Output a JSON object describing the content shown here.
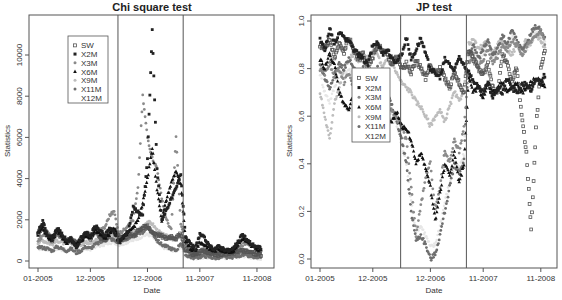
{
  "chart_data": [
    {
      "type": "scatter",
      "title": "Chi square test",
      "xlabel": "Date",
      "ylabel": "Statistics",
      "x_unit": "months since 01-2005",
      "xlim": [
        -1,
        48
      ],
      "ylim": [
        -400,
        11700
      ],
      "x_ticks": [
        {
          "value": 0,
          "label": "01-2005"
        },
        {
          "value": 11,
          "label": "12-2005"
        },
        {
          "value": 23,
          "label": "12-2006"
        },
        {
          "value": 34,
          "label": "11-2007"
        },
        {
          "value": 46,
          "label": "11-2008"
        }
      ],
      "y_ticks": [
        {
          "value": 0,
          "label": "0"
        },
        {
          "value": 2000,
          "label": "2000"
        },
        {
          "value": 4000,
          "label": "4000"
        },
        {
          "value": 6000,
          "label": "6000"
        },
        {
          "value": 8000,
          "label": "8000"
        },
        {
          "value": 10000,
          "label": "10000"
        }
      ],
      "vertical_lines": [
        16.8,
        30.5
      ],
      "legend_position": "top-left",
      "grid": false,
      "x": [
        0,
        1,
        2,
        3,
        4,
        5,
        6,
        7,
        8,
        9,
        10,
        11,
        12,
        13,
        14,
        15,
        16,
        17,
        18,
        19,
        20,
        21,
        22,
        23,
        24,
        25,
        26,
        27,
        28,
        29,
        30,
        31,
        32,
        33,
        34,
        35,
        36,
        37,
        38,
        39,
        40,
        41,
        42,
        43,
        44,
        45,
        46,
        47
      ],
      "series": [
        {
          "name": "SW",
          "marker": "open-square",
          "color": "#555555",
          "values": [
            1300,
            1700,
            1200,
            1000,
            1500,
            1200,
            900,
            1100,
            800,
            1000,
            1300,
            1100,
            1500,
            1200,
            1000,
            1400,
            1500,
            1200,
            1100,
            1300,
            1200,
            1500,
            1600,
            1700,
            1400,
            1300,
            1200,
            1100,
            1200,
            1100,
            1300,
            600,
            400,
            300,
            400,
            500,
            400,
            350,
            300,
            400,
            350,
            400,
            500,
            500,
            450,
            400,
            350,
            300
          ]
        },
        {
          "name": "X2M",
          "marker": "filled-square",
          "color": "#222222",
          "values": [
            1400,
            1900,
            1300,
            1100,
            1600,
            1300,
            1000,
            1100,
            600,
            1100,
            1400,
            1200,
            1700,
            1500,
            1200,
            1600,
            1400,
            900,
            1200,
            1500,
            2600,
            2400,
            2200,
            5000,
            11200,
            4500,
            2000,
            2500,
            3000,
            3500,
            4200,
            1200,
            800,
            600,
            1300,
            1100,
            700,
            600,
            700,
            600,
            500,
            600,
            900,
            1300,
            1000,
            800,
            700,
            600
          ]
        },
        {
          "name": "X3M",
          "marker": "filled-circle",
          "color": "#8a8a8a",
          "values": [
            1000,
            1200,
            1400,
            1000,
            1300,
            1100,
            900,
            1100,
            900,
            1000,
            1200,
            1300,
            1400,
            1500,
            1600,
            2200,
            2400,
            1300,
            1500,
            1800,
            2000,
            3500,
            8000,
            6000,
            5000,
            4500,
            3000,
            2000,
            1500,
            6000,
            1800,
            900,
            500,
            400,
            500,
            600,
            500,
            450,
            400,
            500,
            450,
            500,
            700,
            800,
            900,
            700,
            500,
            400
          ]
        },
        {
          "name": "X6M",
          "marker": "filled-triangle",
          "color": "#111111",
          "values": [
            1300,
            1600,
            1200,
            1000,
            1500,
            1200,
            900,
            1000,
            800,
            1000,
            1200,
            1100,
            1500,
            1300,
            1100,
            1300,
            1600,
            1000,
            1200,
            1400,
            1600,
            2000,
            2800,
            4000,
            5500,
            3500,
            2000,
            3000,
            3800,
            4400,
            3700,
            1000,
            600,
            500,
            900,
            800,
            600,
            500,
            600,
            500,
            450,
            500,
            800,
            1100,
            900,
            700,
            600,
            500
          ]
        },
        {
          "name": "X9M",
          "marker": "plus",
          "color": "#bdbdbd",
          "values": [
            900,
            1000,
            900,
            800,
            1000,
            900,
            800,
            900,
            700,
            800,
            900,
            900,
            1000,
            1100,
            1200,
            1300,
            1200,
            1100,
            1200,
            1300,
            1400,
            1500,
            1700,
            1900,
            1800,
            1500,
            1300,
            1200,
            1100,
            1000,
            1300,
            500,
            300,
            250,
            300,
            350,
            300,
            250,
            250,
            300,
            250,
            300,
            350,
            400,
            350,
            300,
            250,
            200
          ]
        },
        {
          "name": "X11M",
          "marker": "filled-circle",
          "color": "#6e6e6e",
          "values": [
            700,
            650,
            600,
            500,
            700,
            600,
            500,
            600,
            400,
            500,
            700,
            600,
            800,
            900,
            1000,
            1100,
            1000,
            900,
            1000,
            1100,
            1200,
            1300,
            1400,
            1600,
            1400,
            1000,
            800,
            700,
            600,
            500,
            900,
            300,
            200,
            150,
            200,
            250,
            200,
            150,
            150,
            200,
            150,
            200,
            250,
            300,
            250,
            200,
            150,
            100
          ]
        },
        {
          "name": "X12M",
          "marker": "none",
          "color": "#e6e6e6",
          "values": [
            600,
            600,
            550,
            500,
            600,
            550,
            500,
            550,
            450,
            500,
            600,
            550,
            700,
            750,
            800,
            900,
            900,
            800,
            850,
            950,
            1000,
            1100,
            1200,
            1300,
            1200,
            900,
            700,
            600,
            550,
            500,
            700,
            250,
            180,
            150,
            180,
            200,
            180,
            150,
            150,
            180,
            150,
            180,
            200,
            250,
            220,
            180,
            150,
            100
          ]
        }
      ]
    },
    {
      "type": "scatter",
      "title": "JP test",
      "xlabel": "Date",
      "ylabel": "Statistics",
      "x_unit": "months since 01-2005",
      "xlim": [
        -1,
        48
      ],
      "ylim": [
        -0.04,
        1.04
      ],
      "x_ticks": [
        {
          "value": 0,
          "label": "01-2005"
        },
        {
          "value": 11,
          "label": "12-2005"
        },
        {
          "value": 23,
          "label": "12-2006"
        },
        {
          "value": 34,
          "label": "11-2007"
        },
        {
          "value": 46,
          "label": "11-2008"
        }
      ],
      "y_ticks": [
        {
          "value": 0.0,
          "label": "0.0"
        },
        {
          "value": 0.2,
          "label": "0.2"
        },
        {
          "value": 0.4,
          "label": "0.4"
        },
        {
          "value": 0.6,
          "label": "0.6"
        },
        {
          "value": 0.8,
          "label": "0.8"
        },
        {
          "value": 1.0,
          "label": "1.0"
        }
      ],
      "vertical_lines": [
        16.8,
        30.5
      ],
      "legend_position": "center-left",
      "grid": false,
      "x": [
        0,
        1,
        2,
        3,
        4,
        5,
        6,
        7,
        8,
        9,
        10,
        11,
        12,
        13,
        14,
        15,
        16,
        17,
        18,
        19,
        20,
        21,
        22,
        23,
        24,
        25,
        26,
        27,
        28,
        29,
        30,
        31,
        32,
        33,
        34,
        35,
        36,
        37,
        38,
        39,
        40,
        41,
        42,
        43,
        44,
        45,
        46,
        47
      ],
      "series": [
        {
          "name": "SW",
          "marker": "open-square",
          "color": "#555555",
          "values": [
            0.9,
            0.88,
            0.92,
            0.85,
            0.9,
            0.87,
            0.93,
            0.88,
            0.84,
            0.86,
            0.8,
            0.85,
            0.9,
            0.88,
            0.86,
            0.82,
            0.85,
            0.8,
            0.82,
            0.78,
            0.84,
            0.8,
            0.76,
            0.82,
            0.78,
            0.8,
            0.76,
            0.72,
            0.78,
            0.74,
            0.7,
            0.88,
            0.84,
            0.8,
            0.78,
            0.82,
            0.72,
            0.7,
            0.86,
            0.82,
            0.75,
            0.8,
            0.6,
            0.45,
            0.12,
            0.55,
            0.8,
            0.9
          ]
        },
        {
          "name": "X2M",
          "marker": "filled-square",
          "color": "#222222",
          "values": [
            0.92,
            0.88,
            0.97,
            0.9,
            0.95,
            0.93,
            0.92,
            0.88,
            0.86,
            0.84,
            0.82,
            0.9,
            0.91,
            0.86,
            0.88,
            0.84,
            0.83,
            0.86,
            0.93,
            0.84,
            0.88,
            0.93,
            0.86,
            0.8,
            0.78,
            0.76,
            0.84,
            0.82,
            0.79,
            0.85,
            0.82,
            0.78,
            0.75,
            0.72,
            0.7,
            0.74,
            0.68,
            0.72,
            0.7,
            0.76,
            0.72,
            0.7,
            0.73,
            0.74,
            0.7,
            0.76,
            0.74,
            0.78
          ]
        },
        {
          "name": "X3M",
          "marker": "filled-circle",
          "color": "#8a8a8a",
          "values": [
            0.8,
            0.78,
            0.82,
            0.76,
            0.8,
            0.74,
            0.78,
            0.72,
            0.76,
            0.7,
            0.74,
            0.72,
            0.78,
            0.7,
            0.66,
            0.62,
            0.6,
            0.55,
            0.5,
            0.3,
            0.1,
            0.22,
            0.35,
            0.4,
            0.2,
            0.3,
            0.45,
            0.4,
            0.5,
            0.45,
            0.55,
            0.82,
            0.86,
            0.8,
            0.84,
            0.88,
            0.82,
            0.85,
            0.9,
            0.88,
            0.92,
            0.9,
            0.86,
            0.88,
            0.92,
            0.94,
            0.96,
            0.9
          ]
        },
        {
          "name": "X6M",
          "marker": "filled-triangle",
          "color": "#111111",
          "values": [
            0.84,
            0.8,
            0.86,
            0.82,
            0.7,
            0.65,
            0.62,
            0.7,
            0.66,
            0.72,
            0.68,
            0.7,
            0.74,
            0.66,
            0.6,
            0.58,
            0.62,
            0.56,
            0.55,
            0.5,
            0.4,
            0.45,
            0.38,
            0.3,
            0.16,
            0.28,
            0.4,
            0.35,
            0.45,
            0.32,
            0.4,
            0.76,
            0.7,
            0.72,
            0.68,
            0.74,
            0.7,
            0.72,
            0.74,
            0.7,
            0.72,
            0.74,
            0.7,
            0.72,
            0.74,
            0.76,
            0.74,
            0.72
          ]
        },
        {
          "name": "X9M",
          "marker": "plus",
          "color": "#bdbdbd",
          "values": [
            0.7,
            0.6,
            0.5,
            0.66,
            0.72,
            0.8,
            0.84,
            0.86,
            0.82,
            0.86,
            0.84,
            0.88,
            0.86,
            0.8,
            0.84,
            0.82,
            0.78,
            0.74,
            0.72,
            0.7,
            0.66,
            0.64,
            0.6,
            0.56,
            0.6,
            0.62,
            0.58,
            0.64,
            0.7,
            0.66,
            0.72,
            0.9,
            0.92,
            0.88,
            0.9,
            0.92,
            0.86,
            0.9,
            0.92,
            0.88,
            0.86,
            0.9,
            0.88,
            0.92,
            0.9,
            0.94,
            0.92,
            0.88
          ]
        },
        {
          "name": "X11M",
          "marker": "filled-circle",
          "color": "#6e6e6e",
          "values": [
            0.82,
            0.76,
            0.72,
            0.78,
            0.82,
            0.8,
            0.84,
            0.8,
            0.78,
            0.8,
            0.76,
            0.78,
            0.8,
            0.74,
            0.7,
            0.64,
            0.58,
            0.5,
            0.4,
            0.2,
            0.08,
            0.1,
            0.06,
            0.0,
            0.02,
            0.1,
            0.2,
            0.3,
            0.4,
            0.36,
            0.42,
            0.86,
            0.9,
            0.84,
            0.88,
            0.92,
            0.86,
            0.88,
            0.94,
            0.9,
            0.96,
            0.92,
            0.88,
            0.9,
            0.95,
            0.98,
            0.96,
            0.92
          ]
        },
        {
          "name": "X12M",
          "marker": "none",
          "color": "#e6e6e6",
          "values": [
            0.78,
            0.7,
            0.66,
            0.72,
            0.78,
            0.76,
            0.8,
            0.76,
            0.74,
            0.76,
            0.72,
            0.74,
            0.76,
            0.7,
            0.66,
            0.6,
            0.56,
            0.48,
            0.4,
            0.24,
            0.12,
            0.14,
            0.1,
            0.05,
            0.06,
            0.14,
            0.24,
            0.32,
            0.4,
            0.38,
            0.44,
            0.84,
            0.88,
            0.82,
            0.86,
            0.9,
            0.84,
            0.86,
            0.92,
            0.88,
            0.94,
            0.9,
            0.86,
            0.88,
            0.92,
            0.96,
            0.94,
            0.9
          ]
        }
      ]
    }
  ]
}
